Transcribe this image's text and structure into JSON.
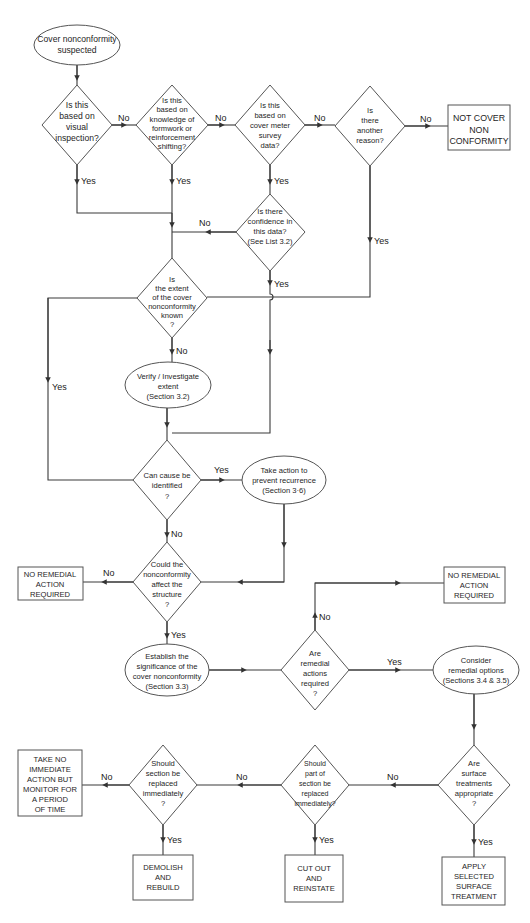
{
  "flowchart": {
    "start": {
      "lines": [
        "Cover nonconformity",
        "suspected"
      ]
    },
    "decisions": {
      "visual": {
        "lines": [
          "Is this",
          "based on",
          "visual",
          "inspection?"
        ]
      },
      "knowledge": {
        "lines": [
          "Is this",
          "based on",
          "knowledge of",
          "formwork or",
          "reinforcement",
          "shifting?"
        ]
      },
      "cover_meter": {
        "lines": [
          "Is this",
          "based on",
          "cover meter",
          "survey",
          "data?"
        ]
      },
      "another_reason": {
        "lines": [
          "Is",
          "there",
          "another",
          "reason?"
        ]
      },
      "confidence": {
        "lines": [
          "Is there",
          "confidence in",
          "this data?",
          "(See List 3.2)"
        ]
      },
      "extent_known": {
        "lines": [
          "Is",
          "the extent",
          "of the cover",
          "nonconformity",
          "known",
          "?"
        ]
      },
      "cause": {
        "lines": [
          "Can cause be",
          "identified",
          "?"
        ]
      },
      "affect": {
        "lines": [
          "Could the",
          "nonconformity",
          "affect the",
          "structure",
          "?"
        ]
      },
      "remedial_required": {
        "lines": [
          "Are",
          "remedial",
          "actions",
          "required",
          "?"
        ]
      },
      "surface": {
        "lines": [
          "Are",
          "surface",
          "treatments",
          "appropriate",
          "?"
        ]
      },
      "part_replace": {
        "lines": [
          "Should",
          "part of",
          "section be",
          "replaced",
          "immediately?"
        ]
      },
      "section_replace": {
        "lines": [
          "Should",
          "section be",
          "replaced",
          "immediately",
          "?"
        ]
      }
    },
    "processes": {
      "verify": {
        "lines": [
          "Verify / Investigate",
          "extent",
          "(Section 3.2)"
        ]
      },
      "take_action": {
        "lines": [
          "Take action to",
          "prevent recurrence",
          "(Section 3·6)"
        ]
      },
      "establish": {
        "lines": [
          "Establish the",
          "significance of the",
          "cover nonconformity",
          "(Section 3.3)"
        ]
      },
      "consider": {
        "lines": [
          "Consider",
          "remedial options",
          "(Sections 3.4 & 3.5)"
        ]
      }
    },
    "terminals": {
      "not_cover": {
        "lines": [
          "NOT COVER",
          "NON",
          "CONFORMITY"
        ]
      },
      "no_remedial_left": {
        "lines": [
          "NO REMEDIAL",
          "ACTION",
          "REQUIRED"
        ]
      },
      "no_remedial_right": {
        "lines": [
          "NO REMEDIAL",
          "ACTION",
          "REQUIRED"
        ]
      },
      "monitor": {
        "lines": [
          "TAKE NO",
          "IMMEDIATE",
          "ACTION BUT",
          "MONITOR FOR",
          "A PERIOD",
          "OF TIME"
        ]
      },
      "demolish": {
        "lines": [
          "DEMOLISH",
          "AND",
          "REBUILD"
        ]
      },
      "cut_out": {
        "lines": [
          "CUT OUT",
          "AND",
          "REINSTATE"
        ]
      },
      "apply": {
        "lines": [
          "APPLY",
          "SELECTED",
          "SURFACE",
          "TREATMENT"
        ]
      }
    },
    "edge_labels": {
      "yes": "Yes",
      "no": "No"
    }
  }
}
